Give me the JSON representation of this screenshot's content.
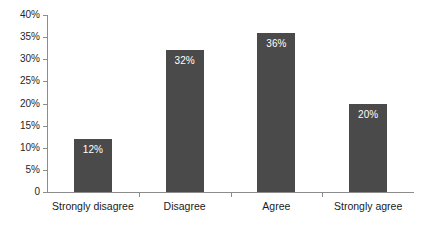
{
  "chart_data": {
    "type": "bar",
    "title": "",
    "xlabel": "",
    "ylabel": "",
    "categories": [
      "Strongly disagree",
      "Disagree",
      "Agree",
      "Strongly agree"
    ],
    "values": [
      12,
      32,
      36,
      20
    ],
    "data_labels": [
      "12%",
      "32%",
      "36%",
      "20%"
    ],
    "ylim": [
      0,
      40
    ],
    "ytick_values": [
      0,
      5,
      10,
      15,
      20,
      25,
      30,
      35,
      40
    ],
    "ytick_labels": [
      "0",
      "5%",
      "10%",
      "15%",
      "20%",
      "25%",
      "30%",
      "35%",
      "40%"
    ],
    "grid": false,
    "legend": false,
    "bar_color": "#4a4a4a",
    "axis_color": "#8c8c8c",
    "label_color": "#1a1a1a",
    "data_label_color": "#ffffff",
    "background_color": "#ffffff"
  }
}
